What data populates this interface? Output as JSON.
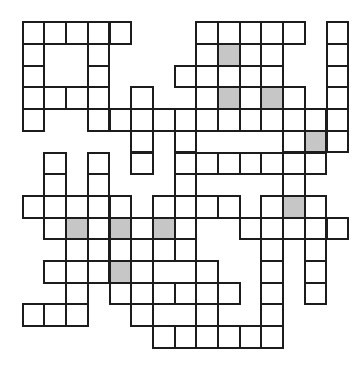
{
  "puzzle": {
    "type": "crossword",
    "rows": 15,
    "cols": 15,
    "colors": {
      "background": "#ffffff",
      "cell_fill": "#ffffff",
      "shaded_fill": "#c6c6c6",
      "grid_line": "#1c1c1c"
    },
    "cells": [
      [
        0,
        [
          0,
          1,
          2,
          3,
          4,
          8,
          9,
          10,
          11,
          12,
          14
        ],
        []
      ],
      [
        1,
        [
          0,
          3,
          8,
          9,
          10,
          11,
          14
        ],
        [
          9
        ]
      ],
      [
        2,
        [
          0,
          3,
          7,
          8,
          9,
          10,
          11,
          14
        ],
        []
      ],
      [
        3,
        [
          0,
          1,
          2,
          3,
          5,
          8,
          9,
          10,
          11,
          12,
          14
        ],
        [
          9,
          11
        ]
      ],
      [
        4,
        [
          0,
          3,
          4,
          5,
          6,
          7,
          8,
          9,
          10,
          11,
          12,
          13,
          14
        ],
        []
      ],
      [
        5,
        [
          5,
          7,
          12,
          13,
          14
        ],
        [
          13
        ]
      ],
      [
        6,
        [
          1,
          3,
          5,
          7,
          8,
          9,
          10,
          11,
          12,
          13
        ],
        []
      ],
      [
        7,
        [
          1,
          3,
          7,
          12
        ],
        []
      ],
      [
        8,
        [
          0,
          1,
          2,
          3,
          4,
          6,
          7,
          8,
          9,
          11,
          12,
          13
        ],
        [
          12
        ]
      ],
      [
        9,
        [
          1,
          2,
          3,
          4,
          5,
          6,
          7,
          10,
          11,
          12,
          13,
          14
        ],
        [
          2,
          4,
          6
        ]
      ],
      [
        10,
        [
          2,
          3,
          4,
          5,
          6,
          7,
          11,
          13
        ],
        []
      ],
      [
        11,
        [
          1,
          2,
          3,
          4,
          5,
          6,
          7,
          8,
          11,
          13
        ],
        [
          4
        ]
      ],
      [
        12,
        [
          2,
          4,
          5,
          6,
          7,
          8,
          9,
          11,
          13
        ],
        []
      ],
      [
        13,
        [
          0,
          1,
          2,
          5,
          6,
          7,
          8,
          9,
          10,
          11
        ],
        []
      ],
      [
        14,
        [
          6,
          7,
          8,
          9,
          10,
          11
        ],
        []
      ]
    ],
    "open_edges": [
      {
        "row": 11,
        "between_cols": [
          6,
          7
        ]
      },
      {
        "row": 13,
        "between_cols": [
          6,
          7
        ]
      },
      {
        "row": 13,
        "between_cols": [
          9,
          10
        ]
      },
      {
        "row": 13,
        "col": 10,
        "side": "top"
      }
    ]
  }
}
